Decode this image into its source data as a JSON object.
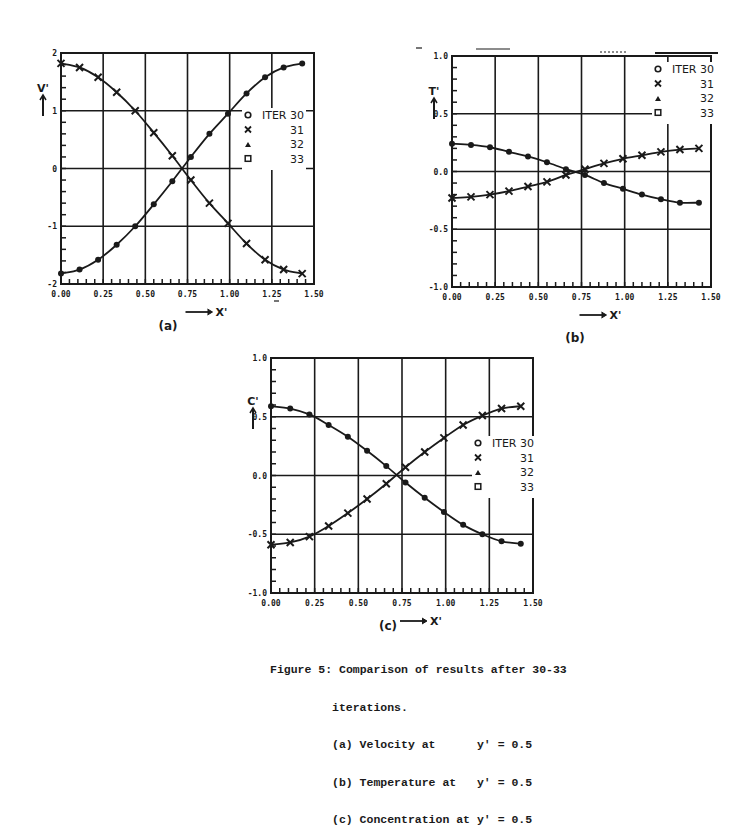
{
  "figure": {
    "caption_title": "Figure 5: Comparison of results after 30-33",
    "caption_line2": "iterations.",
    "caption_items": [
      "(a) Velocity at      y' = 0.5",
      "(b) Temperature at   y' = 0.5",
      "(c) Concentration at y' = 0.5"
    ]
  },
  "legend": {
    "entries": [
      {
        "marker": "circle",
        "label": "o",
        "text": "ITER 30"
      },
      {
        "marker": "x",
        "label": "x",
        "text": "31"
      },
      {
        "marker": "triangle",
        "label": "▲",
        "text": "32"
      },
      {
        "marker": "square",
        "label": "□",
        "text": "33"
      }
    ]
  },
  "chart_data": [
    {
      "id": "a",
      "type": "line",
      "panel_label": "(a)",
      "title": "",
      "xlabel": "X'",
      "ylabel": "V'",
      "xlim": [
        0,
        1.5
      ],
      "ylim": [
        -2,
        2
      ],
      "x_ticks": [
        "0.00",
        "0.25",
        "0.50",
        "0.75",
        "1.00",
        "1.25",
        "1.50"
      ],
      "y_ticks": [
        "-2",
        "-1",
        "0",
        "1",
        "2"
      ],
      "grid": true,
      "legend_position": "right-middle",
      "x": [
        0.0,
        0.11,
        0.22,
        0.33,
        0.44,
        0.55,
        0.66,
        0.77,
        0.88,
        0.99,
        1.1,
        1.21,
        1.32,
        1.43
      ],
      "series": [
        {
          "name": "ITER 30 (o) ascending",
          "values": [
            -1.82,
            -1.75,
            -1.58,
            -1.32,
            -1.0,
            -0.62,
            -0.22,
            0.2,
            0.6,
            0.95,
            1.3,
            1.58,
            1.75,
            1.82
          ]
        },
        {
          "name": "ITER 31 (x) descending",
          "values": [
            1.82,
            1.75,
            1.58,
            1.32,
            1.0,
            0.62,
            0.22,
            -0.2,
            -0.6,
            -0.95,
            -1.3,
            -1.58,
            -1.75,
            -1.82
          ]
        }
      ]
    },
    {
      "id": "b",
      "type": "line",
      "panel_label": "(b)",
      "title": "",
      "xlabel": "X'",
      "ylabel": "T'",
      "xlim": [
        0,
        1.5
      ],
      "ylim": [
        -1.0,
        1.0
      ],
      "x_ticks": [
        "0.00",
        "0.25",
        "0.50",
        "0.75",
        "1.00",
        "1.25",
        "1.50"
      ],
      "y_ticks": [
        "-1.0",
        "-0.5",
        "0.0",
        "0.5",
        "1.0"
      ],
      "grid": true,
      "legend_position": "upper-right",
      "x": [
        0.0,
        0.11,
        0.22,
        0.33,
        0.44,
        0.55,
        0.66,
        0.77,
        0.88,
        0.99,
        1.1,
        1.21,
        1.32,
        1.43
      ],
      "series": [
        {
          "name": "ITER 30 (o) descending",
          "values": [
            0.24,
            0.23,
            0.21,
            0.17,
            0.13,
            0.08,
            0.02,
            -0.03,
            -0.1,
            -0.15,
            -0.2,
            -0.24,
            -0.27,
            -0.27
          ]
        },
        {
          "name": "ITER 31 (x) ascending",
          "values": [
            -0.23,
            -0.22,
            -0.2,
            -0.17,
            -0.13,
            -0.09,
            -0.03,
            0.02,
            0.07,
            0.11,
            0.14,
            0.17,
            0.19,
            0.2
          ]
        }
      ]
    },
    {
      "id": "c",
      "type": "line",
      "panel_label": "(c)",
      "title": "",
      "xlabel": "X'",
      "ylabel": "C'",
      "xlim": [
        0,
        1.5
      ],
      "ylim": [
        -1.0,
        1.0
      ],
      "x_ticks": [
        "0.00",
        "0.25",
        "0.50",
        "0.75",
        "1.00",
        "1.25",
        "1.50"
      ],
      "y_ticks": [
        "-1.0",
        "-0.5",
        "0.0",
        "0.5",
        "1.0"
      ],
      "grid": true,
      "legend_position": "right-middle",
      "x": [
        0.0,
        0.11,
        0.22,
        0.33,
        0.44,
        0.55,
        0.66,
        0.77,
        0.88,
        0.99,
        1.1,
        1.21,
        1.32,
        1.43
      ],
      "series": [
        {
          "name": "ITER 30 (o) descending",
          "values": [
            0.59,
            0.57,
            0.52,
            0.43,
            0.33,
            0.21,
            0.08,
            -0.06,
            -0.19,
            -0.31,
            -0.42,
            -0.5,
            -0.56,
            -0.58
          ]
        },
        {
          "name": "ITER 31 (x) ascending",
          "values": [
            -0.59,
            -0.57,
            -0.52,
            -0.43,
            -0.32,
            -0.2,
            -0.07,
            0.07,
            0.2,
            0.32,
            0.43,
            0.51,
            0.57,
            0.59
          ]
        }
      ]
    }
  ]
}
